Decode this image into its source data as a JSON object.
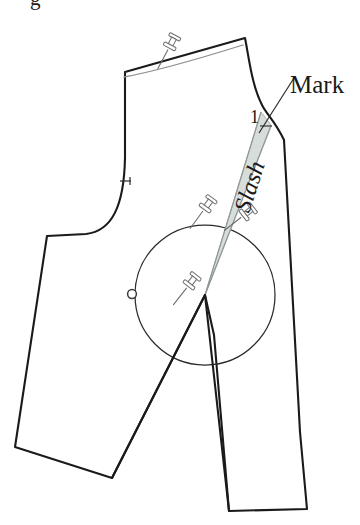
{
  "figure": {
    "kind": "sewing-pattern-technical-illustration",
    "background_color": "#ffffff",
    "clipped_top_caption": "g",
    "line_color": "#1a1a1a",
    "guide_line_color": "#8c8c8c",
    "wedge_fill_color": "#d5dbd8",
    "wedge_edge_color": "#9aa3a0",
    "pin_body_color": "#ffffff",
    "pin_outline_color": "#6e6e6e"
  },
  "labels": {
    "slash": "Slash",
    "mark": "Mark",
    "number_one": "1"
  },
  "annotations": {
    "slash_rotation_deg": -72,
    "mark_leader": "line from Mark text to armhole notch",
    "pivot_point_note": "apex of slash wedge at circle center"
  },
  "markers": {
    "pivot_circle": {
      "cx": 205,
      "cy": 295,
      "r": 70
    },
    "balance_dot": {
      "cx": 132,
      "cy": 294,
      "r": 4.5
    },
    "left_armhole_notch": {
      "x": 126,
      "y": 181
    },
    "right_armhole_notch": {
      "x": 268,
      "y": 126
    }
  },
  "pins": [
    {
      "name": "pin-shoulder",
      "x": 172,
      "y": 40,
      "rotation_deg": 28
    },
    {
      "name": "pin-slash-left",
      "x": 208,
      "y": 205,
      "rotation_deg": 38
    },
    {
      "name": "pin-slash-right",
      "x": 247,
      "y": 213,
      "rotation_deg": 52
    },
    {
      "name": "pin-pivot",
      "x": 192,
      "y": 281,
      "rotation_deg": 38
    }
  ],
  "geometry": {
    "outline_main": "M 125,72 L 245,38 C 250,62 254,92 268,112 C 272,119 278,124 284,140 L 300,430 L 307,509 L 229,511 L 213,330 L 205,295 L 112,478 L 15,447 L 47,235 L 86,234 C 110,232 122,208 125,160 Z",
    "shoulder_guide": "M 124,76 C 155,70 200,58 244,44",
    "wedge": "M 205,295 L 262,113 L 270,123 Z",
    "slash_edge_left": "M 205,295 L 262,113",
    "slash_edge_right": "M 205,295 L 271,124",
    "left_leg_edge": "M 205,295 L 112,478",
    "right_leg_edge": "M 205,295 L 229,511",
    "mark_leader": "M 296,78 L 262,132"
  }
}
